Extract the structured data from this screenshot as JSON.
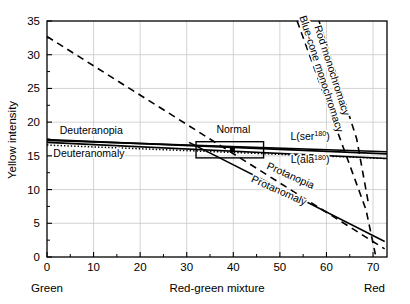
{
  "chart_data": {
    "type": "line",
    "title": "",
    "xlabel": "Red-green mixture",
    "ylabel": "Yellow intensity",
    "xlim": [
      0,
      73
    ],
    "ylim": [
      0,
      35
    ],
    "grid": true,
    "legend_position": "inline-annotations",
    "x_ticks": [
      0,
      10,
      20,
      30,
      40,
      50,
      60,
      70
    ],
    "x_tick_labels": [
      "0",
      "10",
      "20",
      "30",
      "40",
      "50",
      "60",
      "70"
    ],
    "x_minor_ticks": [
      5,
      15,
      25,
      35,
      45,
      55,
      65
    ],
    "y_ticks": [
      0,
      5,
      10,
      15,
      20,
      25,
      30,
      35
    ],
    "y_tick_labels": [
      "0",
      "5",
      "10",
      "15",
      "20",
      "25",
      "30",
      "35"
    ],
    "y_minor_ticks": [
      2.5,
      7.5,
      12.5,
      17.5,
      22.5,
      27.5,
      32.5
    ],
    "x_axis_end_labels": {
      "left": "Green",
      "right": "Red"
    },
    "series": [
      {
        "name": "Rod monochromacy",
        "style": "dashed",
        "orientation": "near-vertical",
        "points": [
          [
            53.7,
            35.0
          ],
          [
            68.5,
            7.0
          ],
          [
            70.5,
            0.4
          ]
        ],
        "label": "Rod monochromacy",
        "label_x": 60.5,
        "label_y": 27.5,
        "label_rotation": 72
      },
      {
        "name": "Blue-cone monochromacy",
        "style": "dashed",
        "orientation": "near-vertical",
        "points": [
          [
            58.4,
            35.0
          ],
          [
            66.5,
            17.5
          ],
          [
            69.0,
            8.0
          ]
        ],
        "label": "Blue-cone monochromacy",
        "label_x": 58.2,
        "label_y": 27.0,
        "label_rotation": 72
      },
      {
        "name": "Normal / Protanopia reference",
        "style": "dashed",
        "points": [
          [
            0,
            32.7
          ],
          [
            72.5,
            1.2
          ]
        ],
        "label": "Protanopia",
        "label_x": 52.0,
        "label_y": 11.6,
        "label_rotation": 24
      },
      {
        "name": "Protanomaly",
        "style": "solid",
        "points": [
          [
            30.5,
            17.0
          ],
          [
            72.5,
            2.3
          ]
        ],
        "label": "Protanomaly",
        "label_x": 49.5,
        "label_y": 9.4,
        "label_rotation": 24
      },
      {
        "name": "Deuteranopia",
        "style": "solid",
        "points": [
          [
            0,
            17.4
          ],
          [
            73,
            15.3
          ]
        ],
        "label": "Deuteranopia",
        "label_x": 9.5,
        "label_y": 18.2,
        "label_rotation": 0
      },
      {
        "name": "Deuteranomaly",
        "style": "dotted",
        "points": [
          [
            0,
            16.6
          ],
          [
            73,
            14.6
          ]
        ],
        "label": "Deuteranomaly",
        "label_x": 9.0,
        "label_y": 14.9,
        "label_rotation": 0
      },
      {
        "name": "L(ser180)",
        "style": "solid",
        "points": [
          [
            0,
            17.3
          ],
          [
            73,
            15.6
          ]
        ],
        "label": "L(ser",
        "label_sup": "180",
        "label_tail": ")",
        "label_x": 56.5,
        "label_y": 17.4
      },
      {
        "name": "L(ala180)",
        "style": "solid",
        "points": [
          [
            0,
            17.0
          ],
          [
            73,
            14.6
          ]
        ],
        "label": "L(ala",
        "label_sup": "180",
        "label_tail": ")",
        "label_x": 56.5,
        "label_y": 13.9
      }
    ],
    "annotations": [
      {
        "name": "Normal",
        "label": "Normal",
        "label_x": 40.0,
        "label_y": 18.4,
        "marker_x": 39.8,
        "marker_y": 15.9,
        "box_x0": 32.0,
        "box_x1": 46.5,
        "box_y0": 14.7,
        "box_y1": 17.1
      }
    ]
  },
  "colors": {
    "line": "#000000",
    "grid": "#c8c8c8",
    "axis": "#000000",
    "background": "#ffffff"
  }
}
